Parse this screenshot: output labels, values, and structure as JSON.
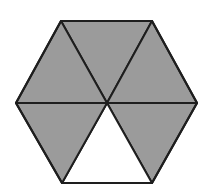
{
  "figure": {
    "shape": "regular-hexagon",
    "total_parts": 6,
    "shaded_parts": 5,
    "unshaded_parts": 1,
    "colors": {
      "shaded_fill": "#9b9b9b",
      "unshaded_fill": "#ffffff",
      "stroke": "#1e1e1e",
      "background": "#ffffff"
    },
    "center": [
      107,
      103
    ],
    "vertices": [
      [
        61,
        21
      ],
      [
        152,
        21
      ],
      [
        197,
        103
      ],
      [
        152,
        183
      ],
      [
        62,
        183
      ],
      [
        16,
        103
      ]
    ],
    "triangles": [
      {
        "name": "top",
        "points": "61,21 152,21 107,103",
        "shaded": true
      },
      {
        "name": "upper-right",
        "points": "152,21 197,103 107,103",
        "shaded": true
      },
      {
        "name": "lower-right",
        "points": "197,103 152,183 107,103",
        "shaded": true
      },
      {
        "name": "bottom",
        "points": "152,183 62,183 107,103",
        "shaded": false
      },
      {
        "name": "lower-left",
        "points": "62,183 16,103 107,103",
        "shaded": true
      },
      {
        "name": "upper-left",
        "points": "16,103 61,21 107,103",
        "shaded": true
      }
    ]
  }
}
